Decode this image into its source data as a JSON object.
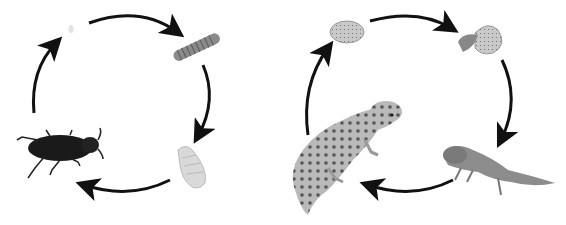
{
  "diagram": {
    "type": "life-cycles",
    "cycles": [
      {
        "name": "beetle-life-cycle",
        "stages": [
          "egg",
          "larva",
          "pupa",
          "adult-beetle"
        ],
        "direction": "clockwise"
      },
      {
        "name": "gecko-life-cycle",
        "stages": [
          "egg",
          "hatching",
          "juvenile-gecko",
          "adult-gecko"
        ],
        "direction": "clockwise"
      }
    ],
    "colors": {
      "arrow": "#111111",
      "background": "#ffffff"
    }
  }
}
